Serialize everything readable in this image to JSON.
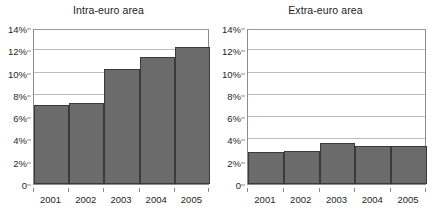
{
  "chart_data": [
    {
      "type": "bar",
      "title": "Intra-euro area",
      "xlabel": "",
      "ylabel": "",
      "categories": [
        "2001",
        "2002",
        "2003",
        "2004",
        "2005"
      ],
      "values": [
        7.1,
        7.3,
        10.35,
        11.4,
        12.3
      ],
      "ylim": [
        0,
        14
      ],
      "yticks": [
        0,
        2,
        4,
        6,
        8,
        10,
        12,
        14
      ],
      "ytick_labels": [
        "0",
        "2%",
        "4%",
        "6%",
        "8%",
        "10%",
        "12%",
        "14%"
      ],
      "grid": true,
      "legend": "none",
      "bar_color": "#6b6b6b",
      "bar_edge_color": "#3a3a3a"
    },
    {
      "type": "bar",
      "title": "Extra-euro area",
      "xlabel": "",
      "ylabel": "",
      "categories": [
        "2001",
        "2002",
        "2003",
        "2004",
        "2005"
      ],
      "values": [
        2.85,
        2.95,
        3.7,
        3.45,
        3.45
      ],
      "ylim": [
        0,
        14
      ],
      "yticks": [
        0,
        2,
        4,
        6,
        8,
        10,
        12,
        14
      ],
      "ytick_labels": [
        "0",
        "2%",
        "4%",
        "6%",
        "8%",
        "10%",
        "12%",
        "14%"
      ],
      "grid": true,
      "legend": "none",
      "bar_color": "#6b6b6b",
      "bar_edge_color": "#3a3a3a"
    }
  ]
}
